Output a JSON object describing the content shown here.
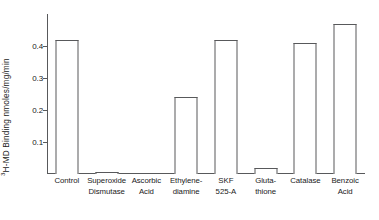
{
  "chart_data": {
    "type": "bar",
    "title": "",
    "xlabel": "",
    "ylabel_prefix": "3",
    "ylabel_rest": "H-MD Binding nmoles/mg/min",
    "categories": [
      "Control",
      "Superoxide Dismutase",
      "Ascorbic Acid",
      "Ethylene-diamine",
      "SKF 525-A",
      "Gluta-thione",
      "Catalase",
      "Benzoic Acid"
    ],
    "category_lines": [
      [
        "Control"
      ],
      [
        "Superoxide",
        "Dismutase"
      ],
      [
        "Ascorbic",
        "Acid"
      ],
      [
        "Ethylene-",
        "diamine"
      ],
      [
        "SKF",
        "525-A"
      ],
      [
        "Gluta-",
        "thione"
      ],
      [
        "Catalase"
      ],
      [
        "Benzoic",
        "Acid"
      ]
    ],
    "values": [
      0.42,
      0.005,
      0.0,
      0.24,
      0.42,
      0.02,
      0.41,
      0.47
    ],
    "yticks": [
      0.1,
      0.2,
      0.3,
      0.4
    ],
    "ytick_labels": [
      "0.1",
      "0.2",
      "0.3",
      "0.4"
    ],
    "ylim": [
      0,
      0.5
    ],
    "grid": false,
    "legend": null,
    "bar_facecolor": "#ffffff",
    "bar_edgecolor": "#58595b",
    "axis_color": "#58595b",
    "text_color": "#1a1a1a"
  }
}
